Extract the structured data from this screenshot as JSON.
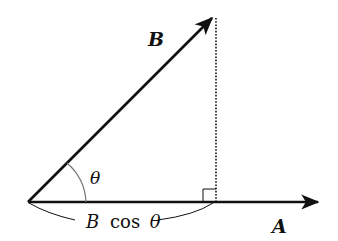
{
  "diagram": {
    "colors": {
      "stroke": "#111111",
      "arc": "#777777",
      "background": "#ffffff"
    },
    "origin": [
      28,
      202
    ],
    "vectors": [
      {
        "name": "B",
        "label": "B",
        "from": [
          28,
          202
        ],
        "to": [
          214,
          16
        ],
        "label_pos": [
          155,
          46
        ]
      },
      {
        "name": "A",
        "label": "A",
        "from": [
          28,
          202
        ],
        "to": [
          320,
          202
        ],
        "label_pos": [
          278,
          232
        ]
      }
    ],
    "angle": {
      "label": "θ",
      "label_pos": [
        96,
        183
      ]
    },
    "projection": {
      "dotted_line": {
        "from": [
          216,
          16
        ],
        "to": [
          216,
          202
        ]
      },
      "right_angle_marker": true,
      "label_B": "B",
      "label_cos": "cos",
      "label_theta": "θ"
    }
  }
}
